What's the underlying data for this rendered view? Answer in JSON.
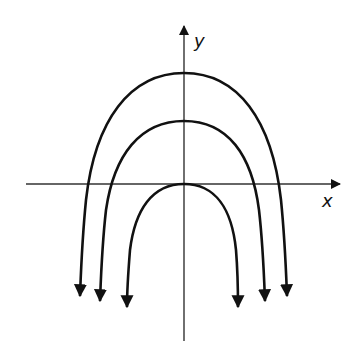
{
  "diagram": {
    "type": "coordinate-plane-parabolas",
    "axes": {
      "x_label": "x",
      "y_label": "y",
      "origin_px": [
        184,
        184
      ]
    },
    "curves": [
      {
        "name": "outer-parabola",
        "vertex_px": [
          184,
          73
        ],
        "left_end_px": [
          80,
          296
        ],
        "right_end_px": [
          287,
          296
        ],
        "opens": "down"
      },
      {
        "name": "middle-parabola",
        "vertex_px": [
          184,
          121
        ],
        "left_end_px": [
          100,
          301
        ],
        "right_end_px": [
          265,
          301
        ],
        "opens": "down"
      },
      {
        "name": "inner-parabola",
        "vertex_px": [
          184,
          184
        ],
        "left_end_px": [
          127,
          307
        ],
        "right_end_px": [
          238,
          307
        ],
        "opens": "down"
      }
    ],
    "colors": {
      "stroke": "#111111",
      "axis": "#333333",
      "background": "#ffffff"
    }
  }
}
